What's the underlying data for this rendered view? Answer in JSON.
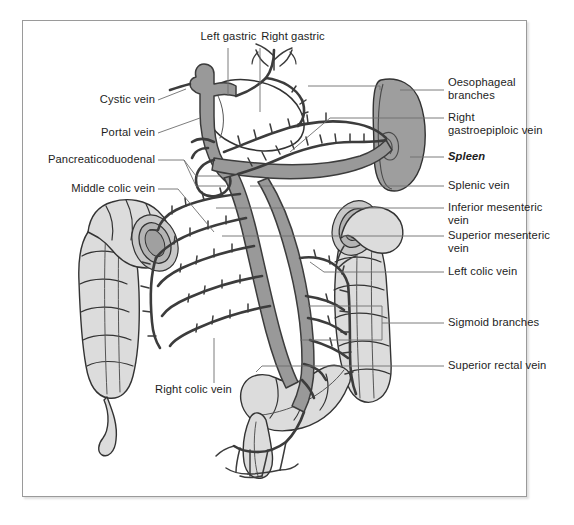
{
  "figure": {
    "kind": "anatomical-line-diagram",
    "background_color": "#ffffff",
    "frame_color": "#9a9a9a"
  },
  "palette": {
    "vein_fill": "#999999",
    "vein_stroke": "#3c3c3c",
    "colon_fill": "#dcdcdc",
    "colon_stroke": "#333333",
    "spleen_fill": "#9e9e9e",
    "spleen_stroke": "#333333",
    "lumen_fill": "#b4b4b4",
    "leader_color": "#6e6e6e",
    "text_color": "#1d1d1d"
  },
  "labels": {
    "left_gastric": "Left gastric",
    "right_gastric": "Right gastric",
    "cystic_vein": "Cystic vein",
    "portal_vein": "Portal vein",
    "pancreaticoduodenal": "Pancreaticoduodenal",
    "middle_colic_vein": "Middle colic vein",
    "right_colic_vein": "Right colic vein",
    "oesophageal_branches": "Oesophageal\nbranches",
    "right_gastroepiploic_vein": "Right\ngastroepiploic vein",
    "spleen": "Spleen",
    "splenic_vein": "Splenic vein",
    "inferior_mesenteric_vein": "Inferior mesenteric\nvein",
    "superior_mesenteric_vein": "Superior mesenteric\nvein",
    "left_colic_vein": "Left colic vein",
    "sigmoid_branches": "Sigmoid branches",
    "superior_rectal_vein": "Superior rectal vein"
  },
  "structures": {
    "organs": [
      "ascending colon",
      "transverse colon",
      "descending colon",
      "sigmoid colon",
      "rectum",
      "appendix",
      "stomach",
      "spleen"
    ],
    "veins": [
      "Portal vein",
      "Cystic vein",
      "Left gastric",
      "Right gastric",
      "Oesophageal branches",
      "Right gastroepiploic vein",
      "Splenic vein",
      "Pancreaticoduodenal",
      "Superior mesenteric vein",
      "Inferior mesenteric vein",
      "Middle colic vein",
      "Right colic vein",
      "Left colic vein",
      "Sigmoid branches",
      "Superior rectal vein"
    ]
  }
}
